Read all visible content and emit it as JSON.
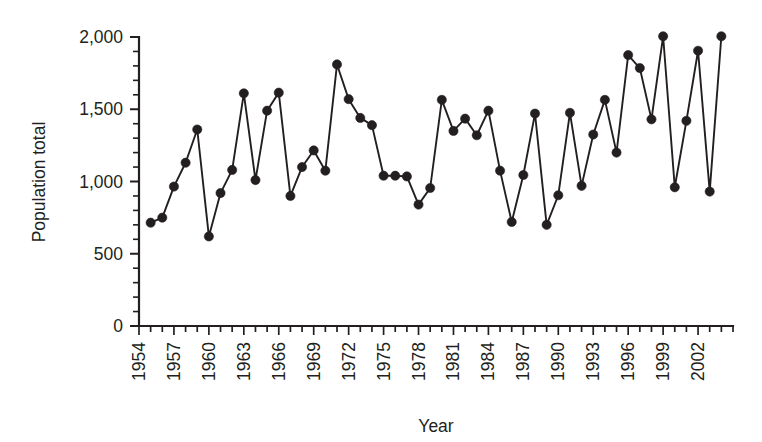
{
  "figure": {
    "background_color": "#ffffff",
    "ink_color": "#231f20"
  },
  "chart_data": {
    "type": "line",
    "title": "",
    "subtitle": "",
    "xlabel": "Year",
    "ylabel": "Population total",
    "xlim": [
      1954,
      2005
    ],
    "ylim": [
      0,
      2000
    ],
    "grid": false,
    "legend": null,
    "marker": "filled-circle",
    "y_ticks_major": [
      0,
      500,
      1000,
      1500,
      2000
    ],
    "y_tick_labels": [
      "0",
      "500",
      "1,000",
      "1,500",
      "2,000"
    ],
    "y_minor_interval": 100,
    "x_tick_labels": [
      "1954",
      "1957",
      "1960",
      "1963",
      "1966",
      "1969",
      "1972",
      "1975",
      "1978",
      "1981",
      "1984",
      "1987",
      "1990",
      "1993",
      "1996",
      "1999",
      "2002"
    ],
    "x_tick_label_rotation": -90,
    "x_tick_interval": 3,
    "x_minor_interval": 1,
    "x": [
      1955,
      1956,
      1957,
      1958,
      1959,
      1960,
      1961,
      1962,
      1963,
      1964,
      1965,
      1966,
      1967,
      1968,
      1969,
      1970,
      1971,
      1972,
      1973,
      1974,
      1975,
      1976,
      1977,
      1978,
      1979,
      1980,
      1981,
      1982,
      1983,
      1984,
      1985,
      1986,
      1987,
      1988,
      1989,
      1990,
      1991,
      1992,
      1993,
      1994,
      1995,
      1996,
      1997,
      1998,
      1999,
      2000,
      2001,
      2002,
      2003,
      2004
    ],
    "values": [
      715,
      750,
      965,
      1130,
      1360,
      620,
      920,
      1080,
      1610,
      1010,
      1490,
      1615,
      900,
      1100,
      1215,
      1075,
      1810,
      1570,
      1440,
      1390,
      1040,
      1040,
      1035,
      840,
      955,
      1565,
      1350,
      1435,
      1320,
      1490,
      1075,
      720,
      1045,
      1470,
      700,
      905,
      1475,
      970,
      1325,
      1565,
      1200,
      1875,
      1785,
      1430,
      2005,
      960,
      1420,
      1905,
      930,
      2005
    ],
    "series": [
      {
        "name": "Population total",
        "values": [
          715,
          750,
          965,
          1130,
          1360,
          620,
          920,
          1080,
          1610,
          1010,
          1490,
          1615,
          900,
          1100,
          1215,
          1075,
          1810,
          1570,
          1440,
          1390,
          1040,
          1040,
          1035,
          840,
          955,
          1565,
          1350,
          1435,
          1320,
          1490,
          1075,
          720,
          1045,
          1470,
          700,
          905,
          1475,
          970,
          1325,
          1565,
          1200,
          1875,
          1785,
          1430,
          2005,
          960,
          1420,
          1905,
          930,
          2005
        ]
      }
    ]
  }
}
